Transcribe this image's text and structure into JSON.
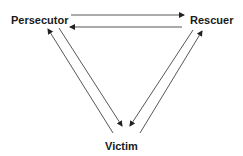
{
  "diagram": {
    "type": "drama-triangle",
    "nodes": {
      "persecutor": "Persecutor",
      "rescuer": "Rescuer",
      "victim": "Victim"
    },
    "edges": [
      {
        "from": "Persecutor",
        "to": "Rescuer"
      },
      {
        "from": "Rescuer",
        "to": "Persecutor"
      },
      {
        "from": "Persecutor",
        "to": "Victim"
      },
      {
        "from": "Victim",
        "to": "Persecutor"
      },
      {
        "from": "Rescuer",
        "to": "Victim"
      },
      {
        "from": "Victim",
        "to": "Rescuer"
      }
    ],
    "colors": {
      "line": "#333333",
      "text": "#1a1a1a"
    }
  }
}
